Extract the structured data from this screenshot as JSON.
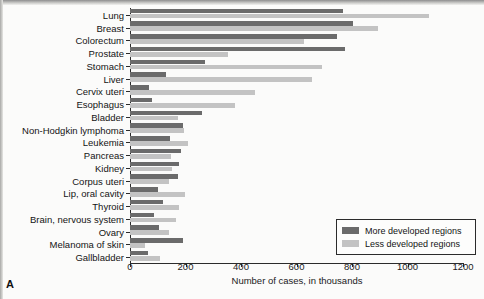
{
  "figure": {
    "panel_letter": "A"
  },
  "legend": {
    "position": "bottom-right",
    "entries": [
      {
        "label": "More developed regions",
        "color": "#6b6b6b",
        "key": "more"
      },
      {
        "label": "Less developed regions",
        "color": "#c3c3c3",
        "key": "less"
      }
    ]
  },
  "chart_data": {
    "type": "bar",
    "orientation": "horizontal",
    "title": "",
    "xlabel": "Number of cases, in thousands",
    "ylabel": "",
    "xlim": [
      0,
      1200
    ],
    "xticks": [
      0,
      200,
      400,
      600,
      800,
      1000,
      1200
    ],
    "xticklabels": [
      "0",
      "200",
      "400",
      "600",
      "800",
      "1000",
      "1200"
    ],
    "grid": false,
    "categories": [
      "Lung",
      "Breast",
      "Colorectum",
      "Prostate",
      "Stomach",
      "Liver",
      "Cervix uteri",
      "Esophagus",
      "Bladder",
      "Non-Hodgkin lymphoma",
      "Leukemia",
      "Pancreas",
      "Kidney",
      "Corpus uteri",
      "Lip, oral cavity",
      "Thyroid",
      "Brain, nervous system",
      "Ovary",
      "Melanoma of skin",
      "Gallbladder"
    ],
    "series": [
      {
        "name": "More developed regions",
        "color": "#6b6b6b",
        "values": [
          768,
          803,
          746,
          775,
          270,
          130,
          69,
          78,
          259,
          192,
          144,
          184,
          175,
          174,
          102,
          119,
          87,
          105,
          192,
          66
        ]
      },
      {
        "name": "Less developed regions",
        "color": "#c3c3c3",
        "values": [
          1077,
          894,
          627,
          353,
          692,
          656,
          450,
          378,
          174,
          195,
          209,
          148,
          151,
          141,
          198,
          177,
          166,
          141,
          54,
          108
        ]
      }
    ]
  }
}
